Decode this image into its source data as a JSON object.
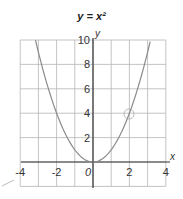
{
  "chart_data": {
    "type": "line",
    "title": "y = x²",
    "xlabel": "x",
    "ylabel": "y",
    "xlim": [
      -4,
      4
    ],
    "ylim": [
      -2,
      10
    ],
    "grid": true,
    "x_ticks": [
      "-4",
      "-2",
      "0",
      "2",
      "4"
    ],
    "y_ticks": [
      "2",
      "4",
      "6",
      "8",
      "10"
    ],
    "series": [
      {
        "name": "y = x²",
        "x": [
          -3.16,
          -3,
          -2,
          -1,
          0,
          1,
          2,
          3,
          3.16
        ],
        "y": [
          10,
          9,
          4,
          1,
          0,
          1,
          4,
          9,
          10
        ]
      }
    ],
    "annotations": [
      {
        "type": "circle",
        "x": 2,
        "y": 4
      }
    ],
    "colors": {
      "curve": "#8a8a8a",
      "grid": "#b5b5b5",
      "axis": "#333333"
    }
  }
}
